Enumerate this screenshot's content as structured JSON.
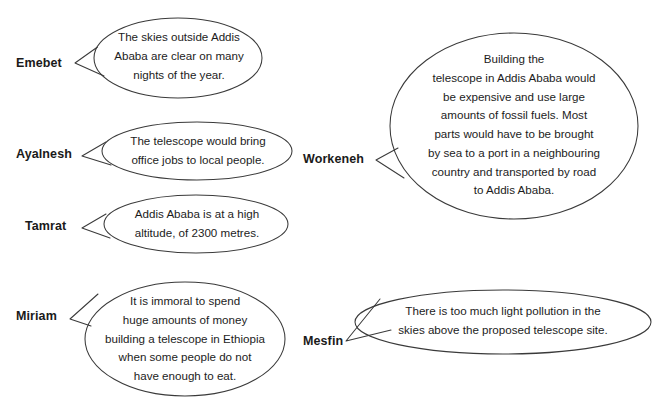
{
  "page": {
    "background_color": "#ffffff",
    "stroke_color": "#3a3a3a",
    "text_color": "#1c1c1c",
    "name_color": "#1a1a1a"
  },
  "bubbles": [
    {
      "id": "emebet",
      "speaker": "Emebet",
      "text": "The skies outside Addis\nAbaba are clear on many\nnights of the year."
    },
    {
      "id": "ayalnesh",
      "speaker": "Ayalnesh",
      "text": "The telescope would bring\noffice jobs to local people."
    },
    {
      "id": "tamrat",
      "speaker": "Tamrat",
      "text": "Addis Ababa is at a high\naltitude, of 2300 metres."
    },
    {
      "id": "miriam",
      "speaker": "Miriam",
      "text": "It is immoral to spend\nhuge amounts of money\nbuilding a telescope in Ethiopia\nwhen some people do not\nhave enough to eat."
    },
    {
      "id": "workeneh",
      "speaker": "Workeneh",
      "text": "Building the\ntelescope in Addis Ababa would\nbe expensive and use large\namounts of fossil fuels. Most\nparts would have to be brought\nby sea to a port in a neighbouring\ncountry and transported by road\nto Addis Ababa."
    },
    {
      "id": "mesfin",
      "speaker": "Mesfin",
      "text": "There is too much light pollution in the\nskies above the proposed telescope site."
    }
  ]
}
